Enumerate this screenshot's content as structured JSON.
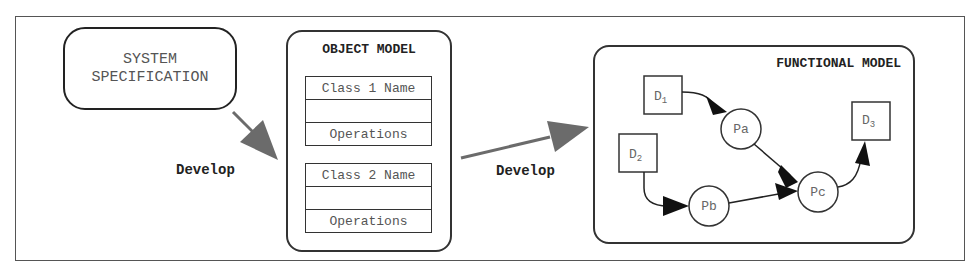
{
  "diagram": {
    "system_spec": {
      "line1": "SYSTEM",
      "line2": "SPECIFICATION"
    },
    "develop_labels": [
      "Develop",
      "Develop"
    ],
    "object_model": {
      "title": "OBJECT MODEL",
      "classes": [
        {
          "name": "Class 1 Name",
          "attributes": "",
          "operations": "Operations"
        },
        {
          "name": "Class 2 Name",
          "attributes": "",
          "operations": "Operations"
        }
      ]
    },
    "functional_model": {
      "title": "FUNCTIONAL MODEL",
      "data_stores": [
        {
          "id": "D1",
          "base": "D",
          "sub": "1"
        },
        {
          "id": "D2",
          "base": "D",
          "sub": "2"
        },
        {
          "id": "D3",
          "base": "D",
          "sub": "3"
        }
      ],
      "processes": [
        "Pa",
        "Pb",
        "Pc"
      ],
      "edges": [
        [
          "D1",
          "Pa"
        ],
        [
          "D2",
          "Pb"
        ],
        [
          "Pa",
          "Pc"
        ],
        [
          "Pb",
          "Pc"
        ],
        [
          "Pc",
          "D3"
        ]
      ]
    },
    "colors": {
      "arrow_gray": "#6b6b6b",
      "line": "#333333",
      "text_gray": "#555555"
    }
  }
}
